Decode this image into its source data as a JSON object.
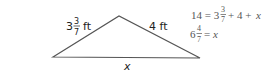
{
  "triangle": {
    "vertices": {
      "left": [
        53,
        57
      ],
      "apex": [
        119,
        16
      ],
      "right": [
        200,
        58
      ]
    },
    "stroke_color": "#555555",
    "labels": {
      "left_side": {
        "whole": "3",
        "numerator": "3",
        "denominator": "7",
        "unit": "ft"
      },
      "right_side": {
        "text": "4 ft"
      },
      "base": {
        "text": "x"
      }
    }
  },
  "equations": [
    {
      "lhs": "14 = 3",
      "fraction": {
        "numerator": "3",
        "denominator": "7"
      },
      "rhs": "+ 4 + ",
      "var": "x"
    },
    {
      "whole": "6",
      "fraction": {
        "numerator": "4",
        "denominator": "7"
      },
      "rhs": "= ",
      "var": "x"
    }
  ]
}
